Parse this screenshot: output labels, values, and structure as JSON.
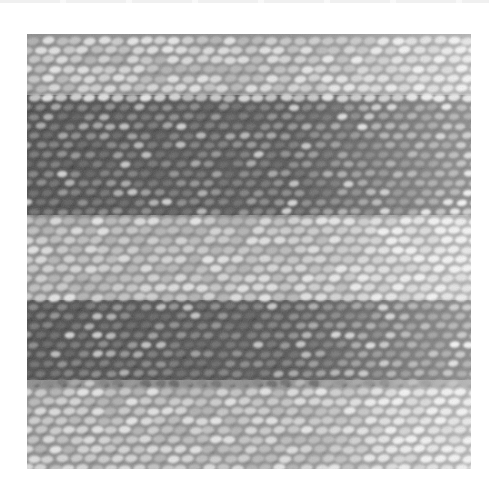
{
  "figure": {
    "color_mode": "grayscale",
    "bands": [
      {
        "tone": "light",
        "top": 0,
        "bottom": 61
      },
      {
        "tone": "dark",
        "top": 61,
        "bottom": 181
      },
      {
        "tone": "light",
        "top": 181,
        "bottom": 266
      },
      {
        "tone": "dark",
        "top": 266,
        "bottom": 346
      },
      {
        "tone": "light",
        "top": 346,
        "bottom": 435
      }
    ],
    "colors": {
      "page_background": "#ffffff",
      "light_yarn": "#d8d8d8",
      "mid_yarn": "#9a9a9a",
      "dark_yarn": "#4a4a4a",
      "shadow": "#2a2a2a"
    }
  }
}
